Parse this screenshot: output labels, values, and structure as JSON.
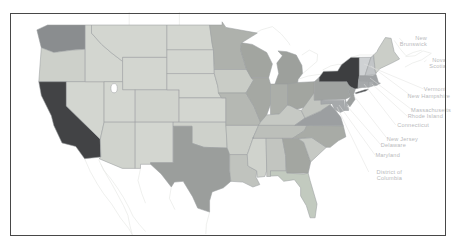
{
  "figure": {
    "type": "choropleth_map",
    "region_title": "United States",
    "background": "#ffffff",
    "frame_color": "#474747",
    "state_border_color": "#9b9da0",
    "neighbor_border_color": "#e4e5e2",
    "water_fill": "#ffffff",
    "annotation_text_color": "#b9babc",
    "leader_line_color": "#e0e0df",
    "annotations": [
      {
        "id": "new-brunswick",
        "lines": [
          "New",
          "Brunswick"
        ]
      },
      {
        "id": "nova-scotia",
        "lines": [
          "Nova",
          "Scotia"
        ]
      },
      {
        "id": "vermont",
        "lines": [
          "Vermont"
        ]
      },
      {
        "id": "new-hampshire",
        "lines": [
          "New Hampshire"
        ]
      },
      {
        "id": "massachusetts",
        "lines": [
          "Massachusetts"
        ]
      },
      {
        "id": "rhode-island",
        "lines": [
          "Rhode Island"
        ]
      },
      {
        "id": "connecticut",
        "lines": [
          "Connecticut"
        ]
      },
      {
        "id": "new-jersey",
        "lines": [
          "New Jersey"
        ]
      },
      {
        "id": "delaware",
        "lines": [
          "Delaware"
        ]
      },
      {
        "id": "maryland",
        "lines": [
          "Maryland"
        ]
      },
      {
        "id": "district-of-columbia",
        "lines": [
          "District of",
          "Columbia"
        ]
      }
    ],
    "states": [
      {
        "id": "WA",
        "name": "Washington",
        "fill": "#8a8d8f"
      },
      {
        "id": "OR",
        "name": "Oregon",
        "fill": "#cdd0ca"
      },
      {
        "id": "CA",
        "name": "California",
        "fill": "#424345"
      },
      {
        "id": "NV",
        "name": "Nevada",
        "fill": "#d3d6d0"
      },
      {
        "id": "ID",
        "name": "Idaho",
        "fill": "#d3d6d0"
      },
      {
        "id": "MT",
        "name": "Montana",
        "fill": "#d3d6d0"
      },
      {
        "id": "WY",
        "name": "Wyoming",
        "fill": "#d3d6d0"
      },
      {
        "id": "UT",
        "name": "Utah",
        "fill": "#d3d6d0"
      },
      {
        "id": "CO",
        "name": "Colorado",
        "fill": "#d0d3cd"
      },
      {
        "id": "AZ",
        "name": "Arizona",
        "fill": "#d0d3cd"
      },
      {
        "id": "NM",
        "name": "New Mexico",
        "fill": "#d3d6d0"
      },
      {
        "id": "ND",
        "name": "North Dakota",
        "fill": "#d3d6d0"
      },
      {
        "id": "SD",
        "name": "South Dakota",
        "fill": "#d3d6d0"
      },
      {
        "id": "NE",
        "name": "Nebraska",
        "fill": "#d3d6d0"
      },
      {
        "id": "KS",
        "name": "Kansas",
        "fill": "#d3d6d0"
      },
      {
        "id": "OK",
        "name": "Oklahoma",
        "fill": "#ced1cb"
      },
      {
        "id": "TX",
        "name": "Texas",
        "fill": "#9b9e9c"
      },
      {
        "id": "MN",
        "name": "Minnesota",
        "fill": "#aeb1ac"
      },
      {
        "id": "IA",
        "name": "Iowa",
        "fill": "#c9ccc6"
      },
      {
        "id": "MO",
        "name": "Missouri",
        "fill": "#b5b8b3"
      },
      {
        "id": "AR",
        "name": "Arkansas",
        "fill": "#cbcec8"
      },
      {
        "id": "LA",
        "name": "Louisiana",
        "fill": "#c0c3be"
      },
      {
        "id": "WI",
        "name": "Wisconsin",
        "fill": "#a2a5a0"
      },
      {
        "id": "MI",
        "name": "Michigan",
        "fill": "#9da09c"
      },
      {
        "id": "IL",
        "name": "Illinois",
        "fill": "#a5a8a3"
      },
      {
        "id": "IN",
        "name": "Indiana",
        "fill": "#abaea9"
      },
      {
        "id": "OH",
        "name": "Ohio",
        "fill": "#a2a5a0"
      },
      {
        "id": "KY",
        "name": "Kentucky",
        "fill": "#c6c9c4"
      },
      {
        "id": "TN",
        "name": "Tennessee",
        "fill": "#bcbfba"
      },
      {
        "id": "MS",
        "name": "Mississippi",
        "fill": "#d0d3cd"
      },
      {
        "id": "AL",
        "name": "Alabama",
        "fill": "#c2c5c0"
      },
      {
        "id": "GA",
        "name": "Georgia",
        "fill": "#a3a6a1"
      },
      {
        "id": "FL",
        "name": "Florida",
        "fill": "#c2cabf"
      },
      {
        "id": "SC",
        "name": "South Carolina",
        "fill": "#c6c9c4"
      },
      {
        "id": "NC",
        "name": "North Carolina",
        "fill": "#a8aba6"
      },
      {
        "id": "VA",
        "name": "Virginia",
        "fill": "#9c9fa1"
      },
      {
        "id": "WV",
        "name": "West Virginia",
        "fill": "#c2c5c0"
      },
      {
        "id": "MD",
        "name": "Maryland",
        "fill": "#a6a9ab"
      },
      {
        "id": "DE",
        "name": "Delaware",
        "fill": "#aaadaf"
      },
      {
        "id": "NJ",
        "name": "New Jersey",
        "fill": "#9da09f"
      },
      {
        "id": "PA",
        "name": "Pennsylvania",
        "fill": "#a0a3a1"
      },
      {
        "id": "NY",
        "name": "New York",
        "fill": "#3d3e40"
      },
      {
        "id": "LI",
        "name": "New York (Long Island)",
        "fill": "#3d3e40"
      },
      {
        "id": "CT",
        "name": "Connecticut",
        "fill": "#a5a8aa"
      },
      {
        "id": "RI",
        "name": "Rhode Island",
        "fill": "#acafb1"
      },
      {
        "id": "MA",
        "name": "Massachusetts",
        "fill": "#a0a3a5"
      },
      {
        "id": "VT",
        "name": "Vermont",
        "fill": "#cfd2d4"
      },
      {
        "id": "NH",
        "name": "New Hampshire",
        "fill": "#c2c5c7"
      },
      {
        "id": "ME",
        "name": "Maine",
        "fill": "#cbcec8"
      }
    ]
  }
}
